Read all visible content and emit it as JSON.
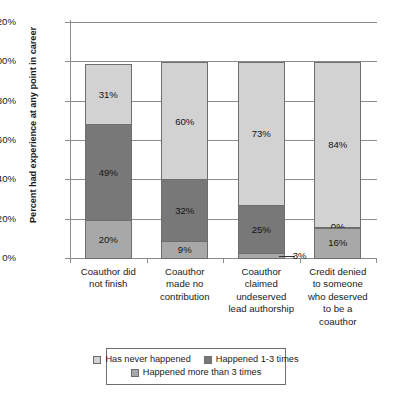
{
  "chart_data": {
    "type": "bar",
    "subtype": "stacked-column-100",
    "title": "",
    "xlabel": "",
    "ylabel": "Percent had experience at any point in career",
    "ylim": [
      0,
      120
    ],
    "ytick_labels": [
      "0%",
      "20%",
      "40%",
      "60%",
      "80%",
      "100%",
      "120%"
    ],
    "ytick_values": [
      0,
      20,
      40,
      60,
      80,
      100,
      120
    ],
    "grid": true,
    "legend_position": "bottom",
    "categories": [
      "Coauthor did not finish",
      "Coauthor made no contribution",
      "Coauthor claimed undeserved lead authorship",
      "Credit denied to someone who deserved to be a coauthor"
    ],
    "category_lines": [
      [
        "Coauthor did",
        "not finish"
      ],
      [
        "Coauthor",
        "made no",
        "contribution"
      ],
      [
        "Coauthor",
        "claimed",
        "undeserved",
        "lead authorship"
      ],
      [
        "Credit denied",
        "to someone",
        "who deserved",
        "to be a",
        "coauthor"
      ]
    ],
    "series": [
      {
        "name": "Happened more than 3 times",
        "color": "#a8a8a8",
        "values": [
          20,
          9,
          3,
          16
        ],
        "labels": [
          "20%",
          "9%",
          "3%",
          "16%"
        ]
      },
      {
        "name": "Happened 1-3 times",
        "color": "#787878",
        "values": [
          49,
          32,
          25,
          0
        ],
        "labels": [
          "49%",
          "32%",
          "25%",
          "0%"
        ]
      },
      {
        "name": "Has never happened",
        "color": "#d2d2d2",
        "values": [
          31,
          60,
          73,
          84
        ],
        "labels": [
          "31%",
          "60%",
          "73%",
          "84%"
        ]
      }
    ],
    "legend_entries": [
      {
        "label": "Has never happened",
        "color": "#d2d2d2"
      },
      {
        "label": "Happened 1-3 times",
        "color": "#787878"
      },
      {
        "label": "Happened more than 3 times",
        "color": "#a8a8a8"
      }
    ],
    "colors": {
      "never": "#d2d2d2",
      "one_to_three": "#787878",
      "more_than_three": "#a8a8a8",
      "axis": "#8c8c8c",
      "text": "#1a1a1a"
    }
  }
}
